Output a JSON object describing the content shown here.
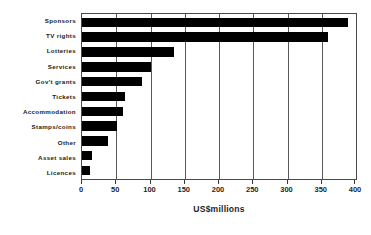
{
  "chart_data": {
    "type": "bar",
    "orientation": "horizontal",
    "title": "",
    "subtitle": "",
    "xlabel": "US$millions",
    "ylabel": "",
    "xlim": [
      0,
      400
    ],
    "xticks": [
      0,
      50,
      100,
      150,
      200,
      250,
      300,
      350,
      400
    ],
    "xtick_labels": [
      "0",
      "50",
      "100",
      "150",
      "200",
      "250",
      "300",
      "350",
      "400"
    ],
    "grid": true,
    "grid_axis": "x",
    "legend": false,
    "legend_position": "none",
    "bar_color": "#000000",
    "plot_border_color": "#4a4a4a",
    "categories": [
      "Sponsors",
      "TV rights",
      "Lotteries",
      "Services",
      "Gov't grants",
      "Tickets",
      "Accommodation",
      "Stamps/coins",
      "Other",
      "Asset sales",
      "Licences"
    ],
    "values": [
      388,
      359,
      135,
      100,
      88,
      63,
      60,
      51,
      38,
      15,
      11
    ],
    "series": [
      {
        "name": "Revenue",
        "values": [
          388,
          359,
          135,
          100,
          88,
          63,
          60,
          51,
          38,
          15,
          11
        ]
      }
    ]
  }
}
